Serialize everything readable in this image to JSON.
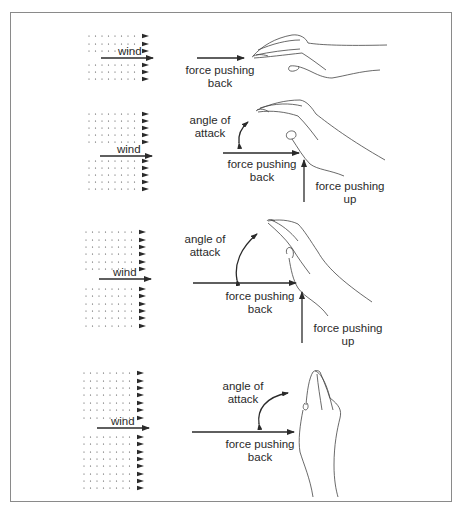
{
  "diagram": {
    "title": "",
    "colors": {
      "ink": "#2a2a2a",
      "frame": "#8a8a8a",
      "background": "#ffffff"
    },
    "panels": [
      {
        "id": 1,
        "hand_orientation": "flat",
        "wind_label": "wind",
        "labels": {
          "force_back": "force pushing back"
        },
        "force_back_line1": "force pushing",
        "force_back_line2": "back"
      },
      {
        "id": 2,
        "hand_orientation": "slightly tilted",
        "wind_label": "wind",
        "angle_line1": "angle of",
        "angle_line2": "attack",
        "force_back_line1": "force pushing",
        "force_back_line2": "back",
        "force_up_line1": "force pushing",
        "force_up_line2": "up"
      },
      {
        "id": 3,
        "hand_orientation": "steeply tilted",
        "wind_label": "wind",
        "angle_line1": "angle of",
        "angle_line2": "attack",
        "force_back_line1": "force pushing",
        "force_back_line2": "back",
        "force_up_line1": "force pushing",
        "force_up_line2": "up"
      },
      {
        "id": 4,
        "hand_orientation": "vertical",
        "wind_label": "wind",
        "angle_line1": "angle of",
        "angle_line2": "attack",
        "force_back_line1": "force pushing",
        "force_back_line2": "back"
      }
    ]
  }
}
